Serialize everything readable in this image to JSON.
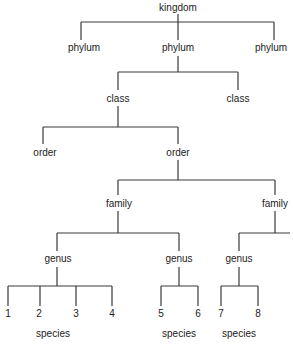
{
  "diagram": {
    "nodes": {
      "kingdom": "kingdom",
      "phylum_left": "phylum",
      "phylum_mid": "phylum",
      "phylum_right": "phylum",
      "class_left": "class",
      "class_right": "class",
      "order_left": "order",
      "order_right": "order",
      "family_left": "family",
      "family_right": "family",
      "genus_1": "genus",
      "genus_2": "genus",
      "genus_3": "genus",
      "species_1": "1",
      "species_2": "2",
      "species_3": "3",
      "species_4": "4",
      "species_5": "5",
      "species_6": "6",
      "species_7": "7",
      "species_8": "8",
      "species_label_1": "species",
      "species_label_2": "species",
      "species_label_3": "species"
    },
    "line_color": "#3a3a3a",
    "text_color": "#222222"
  }
}
